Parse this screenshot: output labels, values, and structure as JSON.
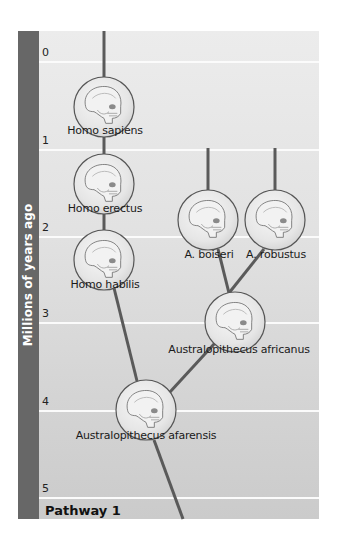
{
  "diagram": {
    "type": "hominid phylogenetic tree",
    "axis": {
      "title": "Millions of years ago",
      "ticks": [
        {
          "label": "0",
          "y": 62
        },
        {
          "label": "1",
          "y": 150
        },
        {
          "label": "2",
          "y": 237
        },
        {
          "label": "3",
          "y": 323
        },
        {
          "label": "4",
          "y": 411
        },
        {
          "label": "5",
          "y": 498
        }
      ]
    },
    "footer_label": "Pathway 1",
    "species": [
      {
        "id": "homo-sapiens",
        "label": "Homo sapiens",
        "cx": 104,
        "cy": 107,
        "label_y": 125
      },
      {
        "id": "homo-erectus",
        "label": "Homo erectus",
        "cx": 104,
        "cy": 184,
        "label_y": 207
      },
      {
        "id": "homo-habilis",
        "label": "Homo habilis",
        "cx": 104,
        "cy": 260,
        "label_y": 280
      },
      {
        "id": "a-boiseri",
        "label": "A. boiseri",
        "cx": 208,
        "cy": 220,
        "label_y": 254
      },
      {
        "id": "a-robustus",
        "label": "A. robustus",
        "cx": 275,
        "cy": 220,
        "label_y": 254
      },
      {
        "id": "australopithecus-africanus",
        "label": "Australopithecus africanus",
        "cx": 235,
        "cy": 322,
        "label_y": 343
      },
      {
        "id": "australopithecus-afarensis",
        "label": "Australopithecus afarensis",
        "cx": 146,
        "cy": 410,
        "label_y": 430
      }
    ],
    "colors": {
      "sidebar": "#676767",
      "branch": "#5a5a5a",
      "gridline": "#fbfbfb"
    }
  }
}
